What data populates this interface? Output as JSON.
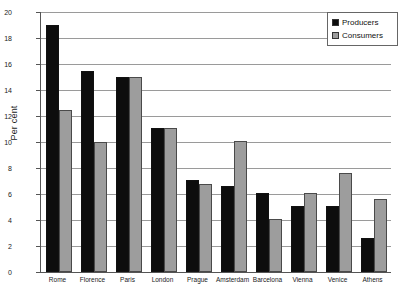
{
  "chart_data": {
    "type": "bar",
    "title": "",
    "xlabel": "",
    "ylabel": "Per cent",
    "ylim": [
      0,
      20
    ],
    "yticks": [
      0,
      2,
      4,
      6,
      8,
      10,
      12,
      14,
      16,
      18,
      20
    ],
    "grid": true,
    "legend_position": "top-right",
    "categories": [
      "Rome",
      "Florence",
      "Paris",
      "London",
      "Prague",
      "Amsterdam",
      "Barcelona",
      "Vienna",
      "Venice",
      "Athens"
    ],
    "series": [
      {
        "name": "Producers",
        "color": "#0d0d0d",
        "values": [
          19.0,
          15.5,
          15.0,
          11.1,
          7.1,
          6.6,
          6.1,
          5.1,
          5.1,
          2.6
        ]
      },
      {
        "name": "Consumers",
        "color": "#9d9d9d",
        "values": [
          12.5,
          10.0,
          15.0,
          11.1,
          6.8,
          10.1,
          4.1,
          6.1,
          7.6,
          5.6
        ]
      }
    ]
  },
  "legend": {
    "items": [
      {
        "label": "Producers",
        "swatch": "producers"
      },
      {
        "label": "Consumers",
        "swatch": "consumers"
      }
    ]
  },
  "axis": {
    "y_title": "Per cent"
  }
}
